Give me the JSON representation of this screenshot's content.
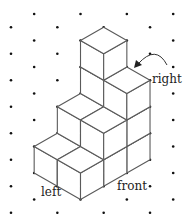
{
  "diagram": {
    "title": "",
    "type": "isometric cube stack on dot grid",
    "grid": {
      "origin_x": 11,
      "origin_y": 14,
      "col_step": 23.17,
      "row_step": 13.25,
      "cols": 8,
      "rows": 16,
      "dot_radius": 1.3
    },
    "projection": {
      "i_offset": 4,
      "m_offset": 7
    },
    "columns": [
      {
        "a": 1,
        "b": 1,
        "height": 4
      },
      {
        "a": 2,
        "b": 1,
        "height": 3
      },
      {
        "a": 1,
        "b": 2,
        "height": 2
      },
      {
        "a": 2,
        "b": 2,
        "height": 2
      },
      {
        "a": 1,
        "b": 3,
        "height": 1
      },
      {
        "a": 2,
        "b": 3,
        "height": 1
      }
    ],
    "total_cubes": 13,
    "labels": {
      "right": "right",
      "front": "front",
      "left": "left"
    },
    "colors": {
      "edge": "#5a5a5a",
      "dot": "#111111",
      "face": "#ffffff"
    }
  }
}
